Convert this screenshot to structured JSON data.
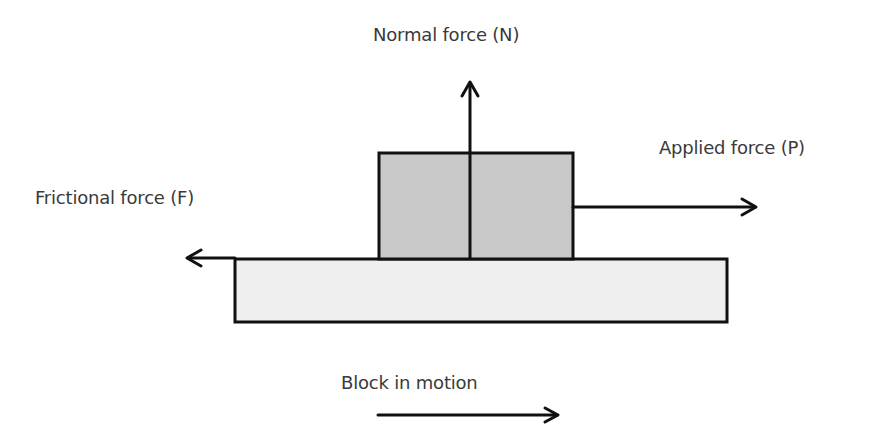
{
  "diagram": {
    "labels": {
      "normal": "Normal force (N)",
      "applied": "Applied force (P)",
      "friction": "Frictional force (F)",
      "motion": "Block in motion"
    },
    "colors": {
      "block_fill": "#c8c8c8",
      "surface_fill": "#efefef",
      "stroke": "#111111",
      "text": "#3a3a3a"
    },
    "elements": [
      {
        "id": "block",
        "type": "rect",
        "desc": "moving block"
      },
      {
        "id": "surface",
        "type": "rect",
        "desc": "ground surface"
      },
      {
        "id": "normal-arrow",
        "direction": "up",
        "label": "Normal force (N)"
      },
      {
        "id": "applied-arrow",
        "direction": "right",
        "label": "Applied force (P)"
      },
      {
        "id": "friction-arrow",
        "direction": "left",
        "label": "Frictional force (F)"
      },
      {
        "id": "motion-arrow",
        "direction": "right",
        "label": "Block in motion"
      }
    ]
  }
}
